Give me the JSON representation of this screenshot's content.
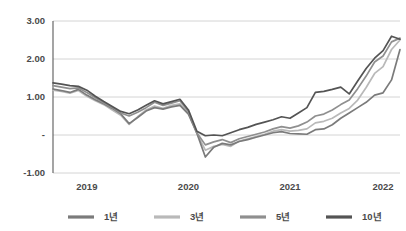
{
  "chart_data": {
    "type": "line",
    "title": "",
    "xlabel": "",
    "ylabel": "",
    "ylim": [
      -1.0,
      3.0
    ],
    "grid": true,
    "legend_position": "bottom",
    "y_ticks": [
      "3.00",
      "2.00",
      "1.00",
      "-",
      "-1.00"
    ],
    "y_tick_values": [
      3.0,
      2.0,
      1.0,
      0.0,
      -1.0
    ],
    "x_tick_labels": [
      "2019",
      "2020",
      "2021",
      "2022"
    ],
    "x_tick_positions": [
      4,
      16,
      28,
      39
    ],
    "x_count": 42,
    "series": [
      {
        "name": "1년",
        "color": "#7b7b7b",
        "values": [
          1.21,
          1.17,
          1.12,
          1.2,
          1.05,
          0.93,
          0.82,
          0.7,
          0.56,
          0.3,
          0.46,
          0.63,
          0.72,
          0.68,
          0.74,
          0.78,
          0.55,
          0.05,
          -0.58,
          -0.32,
          -0.22,
          -0.26,
          -0.17,
          -0.12,
          -0.06,
          0.0,
          0.06,
          0.09,
          0.04,
          0.03,
          0.02,
          0.14,
          0.16,
          0.27,
          0.44,
          0.58,
          0.72,
          0.86,
          1.05,
          1.11,
          1.45,
          2.25
        ]
      },
      {
        "name": "3년",
        "color": "#b9b9b9",
        "values": [
          1.18,
          1.15,
          1.1,
          1.17,
          1.02,
          0.9,
          0.8,
          0.66,
          0.52,
          0.28,
          0.48,
          0.66,
          0.76,
          0.7,
          0.78,
          0.82,
          0.58,
          0.04,
          -0.4,
          -0.3,
          -0.25,
          -0.3,
          -0.16,
          -0.1,
          -0.04,
          0.02,
          0.1,
          0.14,
          0.1,
          0.12,
          0.16,
          0.32,
          0.36,
          0.44,
          0.58,
          0.7,
          0.92,
          1.25,
          1.62,
          1.8,
          2.25,
          2.5
        ]
      },
      {
        "name": "5년",
        "color": "#8f8f8f",
        "values": [
          1.3,
          1.26,
          1.22,
          1.24,
          1.12,
          0.98,
          0.84,
          0.72,
          0.58,
          0.5,
          0.6,
          0.72,
          0.86,
          0.78,
          0.84,
          0.9,
          0.62,
          0.06,
          -0.26,
          -0.18,
          -0.12,
          -0.2,
          -0.1,
          -0.04,
          0.02,
          0.08,
          0.16,
          0.22,
          0.18,
          0.24,
          0.34,
          0.5,
          0.55,
          0.66,
          0.8,
          0.92,
          1.22,
          1.55,
          1.92,
          2.08,
          2.45,
          2.55
        ]
      },
      {
        "name": "10년",
        "color": "#545454",
        "values": [
          1.37,
          1.34,
          1.3,
          1.28,
          1.18,
          1.02,
          0.88,
          0.75,
          0.62,
          0.56,
          0.66,
          0.78,
          0.9,
          0.82,
          0.88,
          0.94,
          0.66,
          0.1,
          -0.02,
          0.0,
          -0.02,
          0.06,
          0.14,
          0.2,
          0.28,
          0.34,
          0.4,
          0.48,
          0.44,
          0.58,
          0.72,
          1.12,
          1.15,
          1.2,
          1.26,
          1.08,
          1.42,
          1.75,
          2.02,
          2.22,
          2.6,
          2.52
        ]
      }
    ]
  },
  "legend": {
    "items": [
      {
        "label": "1년",
        "color": "#7b7b7b"
      },
      {
        "label": "3년",
        "color": "#b9b9b9"
      },
      {
        "label": "5년",
        "color": "#8f8f8f"
      },
      {
        "label": "10년",
        "color": "#545454"
      }
    ]
  },
  "colors": {
    "gridline": "#c9c9c9",
    "axis": "#5a5a5a",
    "text": "#4a4a4a",
    "background": "#ffffff"
  }
}
